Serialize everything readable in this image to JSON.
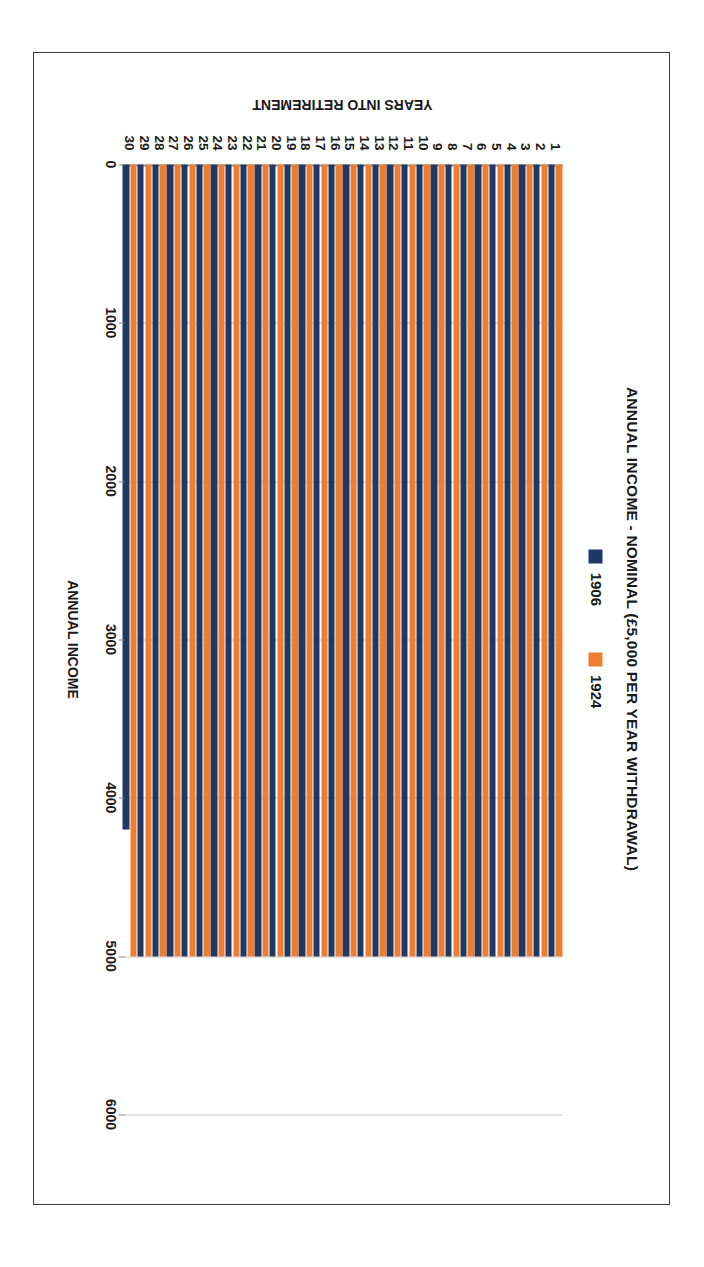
{
  "chart_data": {
    "type": "bar",
    "orientation": "horizontal",
    "title": "ANNUAL INCOME - NOMINAL (£5,000 PER YEAR WITHDRAWAL)",
    "xlabel": "YEARS INTO RETIREMENT",
    "ylabel": "ANNUAL INCOME",
    "categories": [
      1,
      2,
      3,
      4,
      5,
      6,
      7,
      8,
      9,
      10,
      11,
      12,
      13,
      14,
      15,
      16,
      17,
      18,
      19,
      20,
      21,
      22,
      23,
      24,
      25,
      26,
      27,
      28,
      29,
      30
    ],
    "ylim": [
      0,
      6000
    ],
    "yticks": [
      0,
      1000,
      2000,
      3000,
      4000,
      5000,
      6000
    ],
    "grid": true,
    "legend_position": "top",
    "series": [
      {
        "name": "1906",
        "color": "#203864",
        "values": [
          5000,
          5000,
          5000,
          5000,
          5000,
          5000,
          5000,
          5000,
          5000,
          5000,
          5000,
          5000,
          5000,
          5000,
          5000,
          5000,
          5000,
          5000,
          5000,
          5000,
          5000,
          5000,
          5000,
          5000,
          5000,
          5000,
          5000,
          5000,
          5000,
          4200
        ]
      },
      {
        "name": "1924",
        "color": "#ED7D31",
        "values": [
          5000,
          5000,
          5000,
          5000,
          5000,
          5000,
          5000,
          5000,
          5000,
          5000,
          5000,
          5000,
          5000,
          5000,
          5000,
          5000,
          5000,
          5000,
          5000,
          5000,
          5000,
          5000,
          5000,
          5000,
          5000,
          5000,
          5000,
          5000,
          5000,
          5000
        ]
      }
    ]
  },
  "colors": {
    "series_1906": "#203864",
    "series_1924": "#ED7D31",
    "gridline": "#c9c9c9",
    "axis": "#8a8a8a",
    "frame_border": "#3a3a3a",
    "background": "#ffffff",
    "text": "#1a1a1a"
  }
}
